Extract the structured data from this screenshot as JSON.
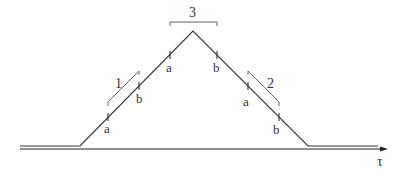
{
  "diagram": {
    "type": "trapezoid-profile",
    "axis": {
      "label": "τ",
      "color": "#222222"
    },
    "profile": {
      "color": "#333333",
      "points": [
        [
          20,
          146
        ],
        [
          80,
          146
        ],
        [
          193,
          31
        ],
        [
          308,
          146
        ],
        [
          378,
          146
        ]
      ]
    },
    "segments": [
      {
        "id": "1",
        "label": "1"
      },
      {
        "id": "2",
        "label": "2"
      },
      {
        "id": "3",
        "label": "3"
      }
    ],
    "markers": [
      {
        "label": "a",
        "segment": "1"
      },
      {
        "label": "b",
        "segment": "1"
      },
      {
        "label": "a",
        "segment": "3"
      },
      {
        "label": "b",
        "segment": "3"
      },
      {
        "label": "a",
        "segment": "2"
      },
      {
        "label": "b",
        "segment": "2"
      }
    ],
    "bracket_color": "#666666"
  }
}
